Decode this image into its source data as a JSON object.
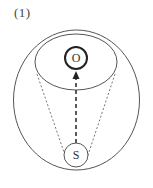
{
  "figure": {
    "label": "(1)"
  },
  "nodes": {
    "top": {
      "label": "O"
    },
    "bottom": {
      "label": "S"
    }
  },
  "colors": {
    "stroke": "#555555",
    "bold_stroke": "#222222",
    "background": "#ffffff"
  }
}
